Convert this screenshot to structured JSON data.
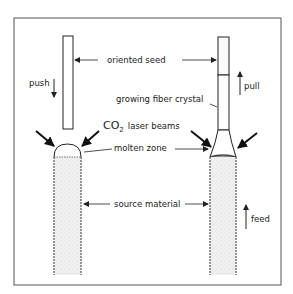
{
  "diagram": {
    "labels": {
      "oriented_seed": "oriented seed",
      "push": "push",
      "pull": "pull",
      "growing_fiber_crystal": "growing fiber crystal",
      "co2": "CO",
      "co2_sub": "2",
      "laser_beams": "laser beams",
      "molten_zone": "molten zone",
      "source_material": "source material",
      "feed": "feed"
    },
    "colors": {
      "line": "#222222",
      "fill_source": "#ececec",
      "background": "#ffffff"
    }
  }
}
